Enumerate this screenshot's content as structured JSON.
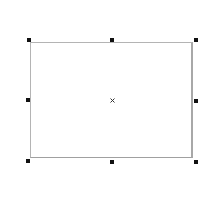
{
  "canvas": {
    "background": "#ffffff"
  },
  "selection": {
    "shape": "rectangle",
    "border_color": "#b4b4b4",
    "fill_color": "#ffffff",
    "handle_color": "#111111",
    "handles": [
      {
        "id": "top-left",
        "x": 27,
        "y": 38
      },
      {
        "id": "top-center",
        "x": 110,
        "y": 38
      },
      {
        "id": "top-right",
        "x": 194,
        "y": 38
      },
      {
        "id": "middle-left",
        "x": 26,
        "y": 98
      },
      {
        "id": "middle-right",
        "x": 194,
        "y": 99
      },
      {
        "id": "bottom-left",
        "x": 26,
        "y": 159
      },
      {
        "id": "bottom-center",
        "x": 110,
        "y": 160
      },
      {
        "id": "bottom-right",
        "x": 194,
        "y": 160
      }
    ],
    "center_marker": "×"
  }
}
